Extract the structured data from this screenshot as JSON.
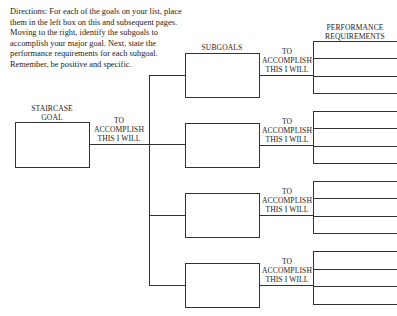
{
  "directions": "Directions: For each of the goals on your list, place them in the left box on this and subsequent pages. Moving to the right, identify the subgoals to accomplish your major goal. Next, state the performance requirements for each subgoal. Remember, be positive and specific.",
  "labels": {
    "staircase_goal_line1": "STAIRCASE",
    "staircase_goal_line2": "GOAL",
    "to_accomplish_line1": "TO",
    "to_accomplish_line2": "ACCOMPLISH",
    "to_accomplish_line3": "THIS I WILL",
    "subgoals": "SUBGOALS",
    "performance_line1": "PERFORMANCE",
    "performance_line2": "REQUIREMENTS"
  },
  "subgoals": [
    {
      "value": ""
    },
    {
      "value": ""
    },
    {
      "value": ""
    },
    {
      "value": ""
    }
  ],
  "staircase_goal_value": ""
}
